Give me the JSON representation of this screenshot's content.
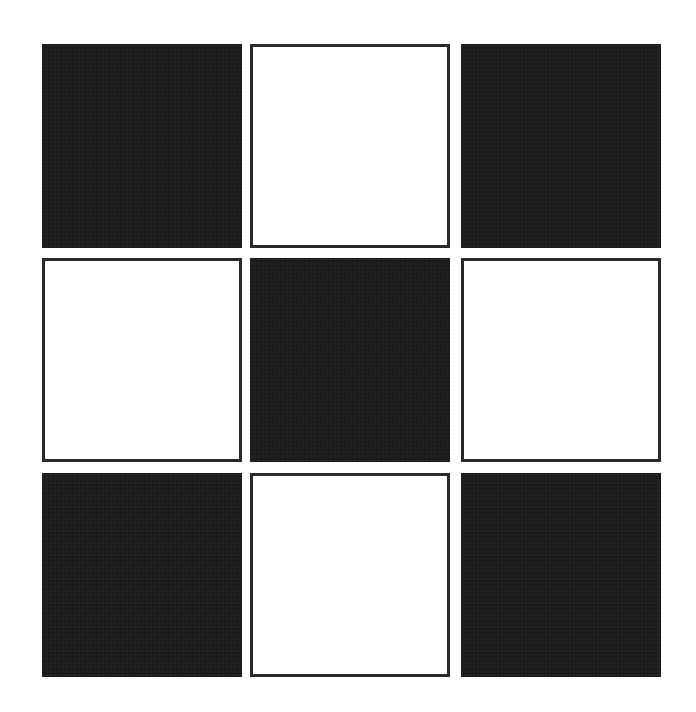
{
  "diagram": {
    "type": "checkerboard-grid",
    "rows": 3,
    "cols": 3,
    "colors": {
      "dark_fill": "#1f1f1f",
      "light_fill": "#ffffff",
      "light_border": "#2a2a2a",
      "background": "#ffffff"
    },
    "cells": [
      {
        "row": 0,
        "col": 0,
        "fill": "dark"
      },
      {
        "row": 0,
        "col": 1,
        "fill": "light"
      },
      {
        "row": 0,
        "col": 2,
        "fill": "dark"
      },
      {
        "row": 1,
        "col": 0,
        "fill": "light"
      },
      {
        "row": 1,
        "col": 1,
        "fill": "dark"
      },
      {
        "row": 1,
        "col": 2,
        "fill": "light"
      },
      {
        "row": 2,
        "col": 0,
        "fill": "dark"
      },
      {
        "row": 2,
        "col": 1,
        "fill": "light"
      },
      {
        "row": 2,
        "col": 2,
        "fill": "dark"
      }
    ],
    "geometry": {
      "col_x": [
        42,
        250,
        461
      ],
      "row_y": [
        44,
        258,
        473
      ],
      "cell_width": 200,
      "cell_height": 204
    }
  }
}
